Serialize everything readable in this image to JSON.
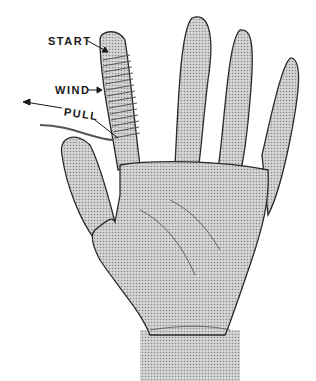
{
  "diagram": {
    "labels": {
      "start": "START",
      "wind": "WIND",
      "pull": "PULL"
    },
    "colors": {
      "skin_fill": "#bdbdbd",
      "outline": "#2a2a2a",
      "string": "#555555",
      "background": "#ffffff"
    }
  }
}
